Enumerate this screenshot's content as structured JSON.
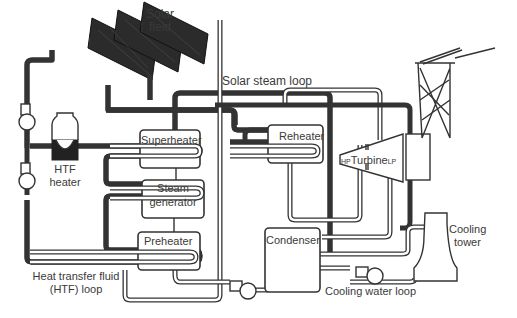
{
  "labels": {
    "solar_field": [
      "Solar",
      "field"
    ],
    "solar_steam_loop": "Solar steam loop",
    "superheater": "Superheater",
    "reheater": "Reheater",
    "steam_generator": [
      "Steam",
      "generator"
    ],
    "preheater": "Preheater",
    "htf_heater": [
      "HTF",
      "heater"
    ],
    "turbine": {
      "hp": "HP",
      "name": "Turbine",
      "lp": "LP"
    },
    "condenser": "Condenser",
    "cooling_tower": [
      "Cooling",
      "tower"
    ],
    "cooling_water_loop": "Cooling water loop",
    "htf_loop": [
      "Heat transfer fluid",
      "(HTF) loop"
    ]
  },
  "colors": {
    "line": "#333333",
    "background": "#ffffff",
    "collector": "#2b2b2b"
  }
}
